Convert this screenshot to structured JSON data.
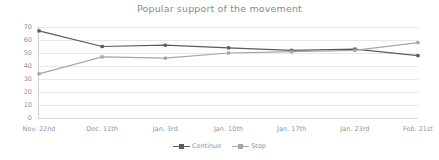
{
  "chart_data": {
    "type": "line",
    "title": "Popular support of the movement",
    "xlabel": "",
    "ylabel": "",
    "categories": [
      "Nov. 22nd",
      "Dec. 11th",
      "Jan. 3rd",
      "Jan. 10th",
      "Jan. 17th",
      "Jan. 23rd",
      "Feb. 21st"
    ],
    "series": [
      {
        "name": "Continue",
        "values": [
          67,
          55,
          56,
          54,
          52,
          53,
          48
        ],
        "color": "#5a5a5a",
        "marker": "square"
      },
      {
        "name": "Stop",
        "values": [
          34,
          47,
          46,
          50,
          51,
          52,
          58
        ],
        "color": "#a6a6a6",
        "marker": "square"
      }
    ],
    "ylim": [
      0,
      70
    ],
    "yticks": [
      0,
      10,
      20,
      30,
      40,
      50,
      60,
      70
    ],
    "ytick_labels": [
      "0",
      "10",
      "20",
      "30",
      "40",
      "50",
      "60",
      "70"
    ],
    "grid": true,
    "grid_axis": "y",
    "legend_position": "bottom",
    "background_color": "#ffffff",
    "grid_color": "#e8e8e8",
    "text_color": "#949494"
  }
}
